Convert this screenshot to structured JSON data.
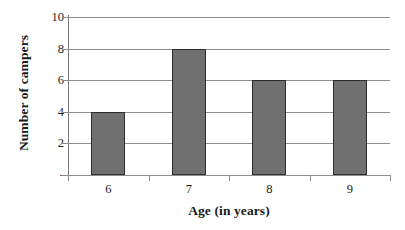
{
  "chart_data": {
    "type": "bar",
    "title": "",
    "categories": [
      "6",
      "7",
      "8",
      "9"
    ],
    "values": [
      4,
      8,
      6,
      6
    ],
    "series": [
      {
        "name": "Number of campers",
        "values": [
          4,
          8,
          6,
          6
        ]
      }
    ],
    "xlabel": "Age (in years)",
    "ylabel": "Number of campers",
    "ylim": [
      0,
      10
    ],
    "y_ticks": [
      0,
      2,
      4,
      6,
      8,
      10
    ],
    "y_tick_labels": [
      "-",
      "2",
      "4",
      "6",
      "8",
      "10"
    ],
    "x_tick_labels": [
      "6",
      "7",
      "8",
      "9"
    ],
    "grid": true,
    "grid_axis": "y",
    "legend": false,
    "legend_position": "none",
    "bar_color": "#707070",
    "bar_border_color": "#2e2e2e",
    "gridline_color": "#8e8e8e",
    "axis_color": "#7a7a7a",
    "background_color": "#ffffff",
    "text_color": "#242424"
  }
}
